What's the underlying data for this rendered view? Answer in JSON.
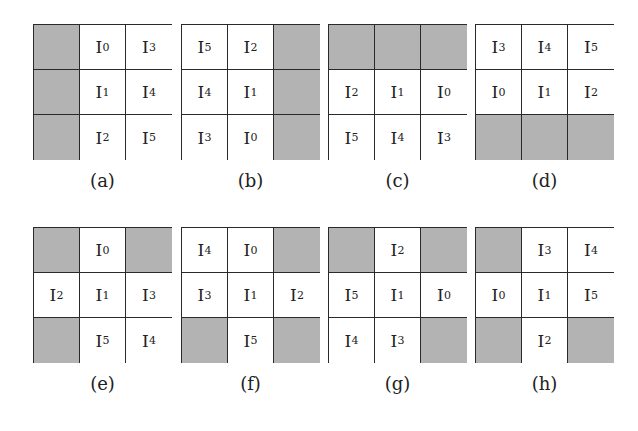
{
  "figure": {
    "colors": {
      "shaded": "#b3b3b3",
      "empty": "#ffffff",
      "border": "#2a2a2a"
    },
    "panels": [
      {
        "caption": "(a)",
        "x": 33,
        "y": 24,
        "cells": [
          [
            "",
            "0",
            "3"
          ],
          [
            "",
            "1",
            "4"
          ],
          [
            "",
            "2",
            "5"
          ]
        ]
      },
      {
        "caption": "(b)",
        "x": 181,
        "y": 24,
        "cells": [
          [
            "5",
            "2",
            ""
          ],
          [
            "4",
            "1",
            ""
          ],
          [
            "3",
            "0",
            ""
          ]
        ]
      },
      {
        "caption": "(c)",
        "x": 328,
        "y": 24,
        "cells": [
          [
            "",
            "",
            ""
          ],
          [
            "2",
            "1",
            "0"
          ],
          [
            "5",
            "4",
            "3"
          ]
        ]
      },
      {
        "caption": "(d)",
        "x": 475,
        "y": 24,
        "cells": [
          [
            "3",
            "4",
            "5"
          ],
          [
            "0",
            "1",
            "2"
          ],
          [
            "",
            "",
            ""
          ]
        ]
      },
      {
        "caption": "(e)",
        "x": 33,
        "y": 227,
        "cells": [
          [
            "",
            "0",
            ""
          ],
          [
            "2",
            "1",
            "3"
          ],
          [
            "",
            "5",
            "4"
          ]
        ]
      },
      {
        "caption": "(f)",
        "x": 181,
        "y": 227,
        "cells": [
          [
            "4",
            "0",
            ""
          ],
          [
            "3",
            "1",
            "2"
          ],
          [
            "",
            "5",
            ""
          ]
        ]
      },
      {
        "caption": "(g)",
        "x": 328,
        "y": 227,
        "cells": [
          [
            "",
            "2",
            ""
          ],
          [
            "5",
            "1",
            "0"
          ],
          [
            "4",
            "3",
            ""
          ]
        ]
      },
      {
        "caption": "(h)",
        "x": 475,
        "y": 227,
        "cells": [
          [
            "",
            "3",
            "4"
          ],
          [
            "0",
            "1",
            "5"
          ],
          [
            "",
            "2",
            ""
          ]
        ]
      }
    ],
    "item_prefix": "I"
  }
}
